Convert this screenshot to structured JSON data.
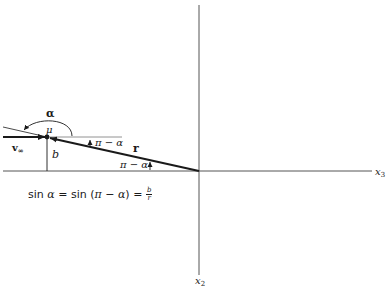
{
  "figure": {
    "axes": {
      "horizontal_label": "x",
      "horizontal_sub": "3",
      "vertical_label": "x",
      "vertical_sub": "2"
    },
    "labels": {
      "alpha": "α",
      "mu": "μ",
      "v_inf": "v",
      "v_inf_sub": "∞",
      "b": "b",
      "r": "r",
      "pi_minus_alpha_top": "π − α",
      "pi_minus_alpha_bottom": "π − α"
    },
    "formula": {
      "left": "sin ",
      "alpha1": "α",
      "eq1": " = sin (",
      "pi": "π",
      "minus": " − ",
      "alpha2": "α",
      "close": ") = ",
      "num": "b",
      "den": "r"
    },
    "colors": {
      "ink": "#1a1a1a",
      "axis": "#555555"
    }
  }
}
